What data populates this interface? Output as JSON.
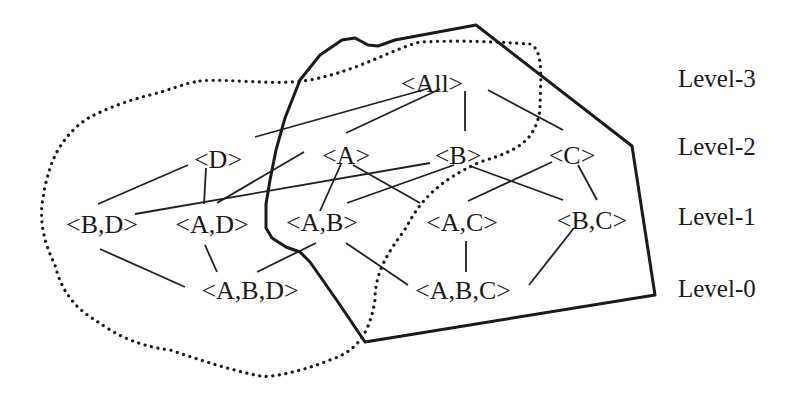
{
  "diagram": {
    "type": "lattice",
    "nodes": [
      {
        "id": "all",
        "label": "<All>",
        "level": 3,
        "x": 432,
        "y": 92
      },
      {
        "id": "d",
        "label": "<D>",
        "level": 2,
        "x": 218,
        "y": 168
      },
      {
        "id": "a",
        "label": "<A>",
        "level": 2,
        "x": 346,
        "y": 164
      },
      {
        "id": "b",
        "label": "<B>",
        "level": 2,
        "x": 458,
        "y": 164
      },
      {
        "id": "c",
        "label": "<C>",
        "level": 2,
        "x": 572,
        "y": 164
      },
      {
        "id": "bd",
        "label": "<B,D>",
        "level": 1,
        "x": 102,
        "y": 233
      },
      {
        "id": "ad",
        "label": "<A,D>",
        "level": 1,
        "x": 212,
        "y": 233
      },
      {
        "id": "ab",
        "label": "<A,B>",
        "level": 1,
        "x": 322,
        "y": 231
      },
      {
        "id": "ac",
        "label": "<A,C>",
        "level": 1,
        "x": 462,
        "y": 231
      },
      {
        "id": "bc",
        "label": "<B,C>",
        "level": 1,
        "x": 592,
        "y": 229
      },
      {
        "id": "abd",
        "label": "<A,B,D>",
        "level": 0,
        "x": 250,
        "y": 299
      },
      {
        "id": "abc",
        "label": "<A,B,C>",
        "level": 0,
        "x": 463,
        "y": 299
      }
    ],
    "edges": [
      {
        "from": "all",
        "to": "d",
        "x1": 430,
        "y1": 88,
        "x2": 255,
        "y2": 137
      },
      {
        "from": "all",
        "to": "a",
        "x1": 440,
        "y1": 89,
        "x2": 346,
        "y2": 133
      },
      {
        "from": "all",
        "to": "b",
        "x1": 465,
        "y1": 91,
        "x2": 465,
        "y2": 131
      },
      {
        "from": "all",
        "to": "c",
        "x1": 488,
        "y1": 90,
        "x2": 563,
        "y2": 130
      },
      {
        "from": "d",
        "to": "bd",
        "x1": 188,
        "y1": 165,
        "x2": 98,
        "y2": 204
      },
      {
        "from": "d",
        "to": "ad",
        "x1": 206,
        "y1": 168,
        "x2": 204,
        "y2": 204
      },
      {
        "from": "a",
        "to": "ad",
        "x1": 304,
        "y1": 152,
        "x2": 217,
        "y2": 203
      },
      {
        "from": "a",
        "to": "ab",
        "x1": 341,
        "y1": 164,
        "x2": 320,
        "y2": 211
      },
      {
        "from": "a",
        "to": "ac",
        "x1": 353,
        "y1": 165,
        "x2": 420,
        "y2": 203
      },
      {
        "from": "b",
        "to": "bd",
        "x1": 430,
        "y1": 163,
        "x2": 135,
        "y2": 214
      },
      {
        "from": "b",
        "to": "ab",
        "x1": 454,
        "y1": 165,
        "x2": 347,
        "y2": 203
      },
      {
        "from": "b",
        "to": "bc",
        "x1": 470,
        "y1": 166,
        "x2": 563,
        "y2": 200
      },
      {
        "from": "c",
        "to": "ac",
        "x1": 552,
        "y1": 162,
        "x2": 468,
        "y2": 201
      },
      {
        "from": "c",
        "to": "bc",
        "x1": 578,
        "y1": 165,
        "x2": 597,
        "y2": 200
      },
      {
        "from": "bd",
        "to": "abd",
        "x1": 100,
        "y1": 249,
        "x2": 185,
        "y2": 287
      },
      {
        "from": "ad",
        "to": "abd",
        "x1": 205,
        "y1": 245,
        "x2": 217,
        "y2": 272
      },
      {
        "from": "ab",
        "to": "abd",
        "x1": 316,
        "y1": 243,
        "x2": 257,
        "y2": 272
      },
      {
        "from": "ab",
        "to": "abc",
        "x1": 346,
        "y1": 243,
        "x2": 408,
        "y2": 285
      },
      {
        "from": "ac",
        "to": "abc",
        "x1": 466,
        "y1": 241,
        "x2": 466,
        "y2": 272
      },
      {
        "from": "bc",
        "to": "abc",
        "x1": 574,
        "y1": 228,
        "x2": 529,
        "y2": 285
      }
    ],
    "levels": [
      {
        "label": "Level-3",
        "x": 678,
        "y": 87
      },
      {
        "label": "Level-2",
        "x": 678,
        "y": 155
      },
      {
        "label": "Level-1",
        "x": 678,
        "y": 225
      },
      {
        "label": "Level-0",
        "x": 678,
        "y": 297
      }
    ],
    "regions": [
      {
        "name": "solid-region",
        "style": "solid"
      },
      {
        "name": "dotted-region",
        "style": "dotted"
      }
    ]
  }
}
